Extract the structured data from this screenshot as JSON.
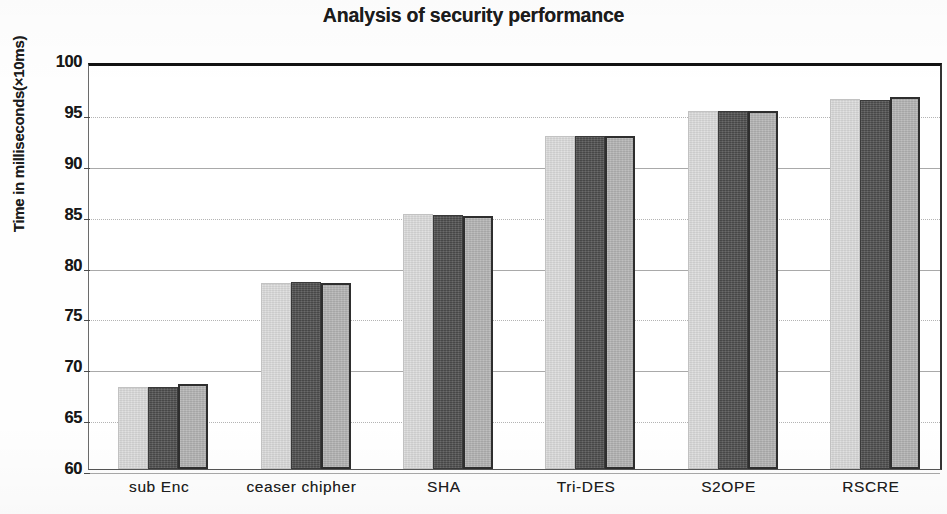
{
  "chart_data": {
    "type": "bar",
    "title": "Analysis of security performance",
    "xlabel": "",
    "ylabel": "Time in milliseconds(×10ms)",
    "categories": [
      "sub Enc",
      "ceaser chipher",
      "SHA",
      "Tri-DES",
      "S2OPE",
      "RSCRE"
    ],
    "series": [
      {
        "name": "Series 1",
        "color": "#dcdcdc",
        "values": [
          68.1,
          78.3,
          85.1,
          92.7,
          95.2,
          96.4
        ]
      },
      {
        "name": "Series 2",
        "color": "#4d4d4d",
        "values": [
          68.1,
          78.4,
          85.0,
          92.7,
          95.2,
          96.3
        ]
      },
      {
        "name": "Series 3",
        "color": "#b3b3b3",
        "values": [
          68.4,
          78.3,
          84.9,
          92.7,
          95.2,
          96.6
        ]
      }
    ],
    "ylim": [
      60,
      100
    ],
    "ytick_labels": [
      "100",
      "95",
      "90",
      "85",
      "80",
      "75",
      "70",
      "65",
      "60"
    ],
    "ytick_values": [
      100,
      95,
      90,
      85,
      80,
      75,
      70,
      65,
      60
    ],
    "grid": true,
    "grid_axis": "y",
    "legend": false,
    "legend_position": "none"
  }
}
